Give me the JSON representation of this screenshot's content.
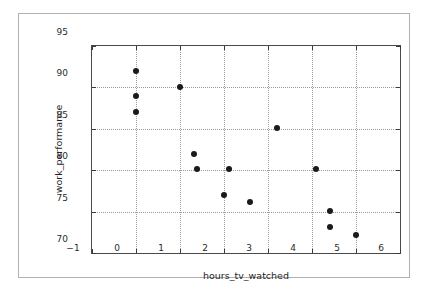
{
  "figure": {
    "background_color": "#ffffff",
    "frame_color": "#b0b0b0",
    "axes_color": "#4a4a4a",
    "grid_color": "#9a9a9a",
    "marker_color": "#1a1a1a"
  },
  "chart_data": {
    "type": "scatter",
    "title": "",
    "xlabel": "hours_tv_watched",
    "ylabel": "work_performance",
    "xlim": [
      -1,
      6
    ],
    "ylim": [
      70,
      95
    ],
    "xticks": [
      -1,
      0,
      1,
      2,
      3,
      4,
      5,
      6
    ],
    "xticklabels": [
      "−1",
      "0",
      "1",
      "2",
      "3",
      "4",
      "5",
      "6"
    ],
    "yticks": [
      70,
      75,
      80,
      85,
      90,
      95
    ],
    "yticklabels": [
      "70",
      "75",
      "80",
      "85",
      "90",
      "95"
    ],
    "grid": true,
    "grid_style": "dotted",
    "legend": null,
    "marker": "circle",
    "marker_size": 6,
    "x": [
      0.0,
      0.0,
      0.0,
      1.0,
      1.32,
      1.39,
      2.01,
      2.11,
      2.6,
      3.2,
      4.1,
      4.4,
      4.4,
      5.0
    ],
    "y": [
      92.0,
      89.0,
      87.0,
      90.0,
      82.0,
      80.1,
      77.0,
      80.1,
      76.1,
      85.1,
      80.1,
      75.1,
      73.2,
      72.2
    ],
    "points": [
      {
        "x": 0.0,
        "y": 92.0
      },
      {
        "x": 0.0,
        "y": 89.0
      },
      {
        "x": 0.0,
        "y": 87.0
      },
      {
        "x": 1.0,
        "y": 90.0
      },
      {
        "x": 1.32,
        "y": 82.0
      },
      {
        "x": 1.39,
        "y": 80.1
      },
      {
        "x": 2.01,
        "y": 77.0
      },
      {
        "x": 2.11,
        "y": 80.1
      },
      {
        "x": 2.6,
        "y": 76.1
      },
      {
        "x": 3.2,
        "y": 85.1
      },
      {
        "x": 4.1,
        "y": 80.1
      },
      {
        "x": 4.4,
        "y": 75.1
      },
      {
        "x": 4.4,
        "y": 73.2
      },
      {
        "x": 5.0,
        "y": 72.2
      }
    ]
  }
}
